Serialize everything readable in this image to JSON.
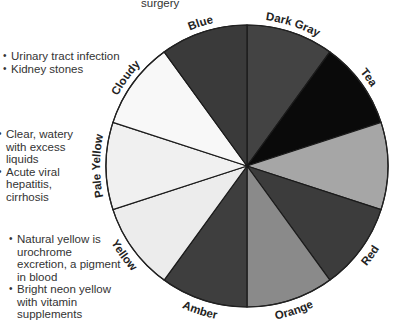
{
  "top_note": "surgery",
  "notes": {
    "cloudy": [
      "Urinary tract infection",
      "Kidney stones"
    ],
    "pale_yellow": [
      "Clear, watery with excess liquids",
      "Acute viral hepatitis, cirrhosis"
    ],
    "yellow": [
      "Natural yellow is urochrome excretion, a pigment in blood",
      "Bright neon yellow with vitamin supplements"
    ]
  },
  "wheel": {
    "center": [
      247,
      166
    ],
    "radius": 141,
    "segments": [
      {
        "label": "Dark Gray",
        "start": 0,
        "end": 36,
        "color": "#434343"
      },
      {
        "label": "Tea",
        "start": 36,
        "end": 72,
        "color": "#0a0a0a"
      },
      {
        "label": "",
        "start": 72,
        "end": 108,
        "color": "#a6a6a6"
      },
      {
        "label": "Red",
        "start": 108,
        "end": 144,
        "color": "#3c3c3c"
      },
      {
        "label": "Orange",
        "start": 144,
        "end": 180,
        "color": "#8a8a8a"
      },
      {
        "label": "Amber",
        "start": 180,
        "end": 216,
        "color": "#3e3e3e"
      },
      {
        "label": "Yellow",
        "start": 216,
        "end": 252,
        "color": "#ececec"
      },
      {
        "label": "Pale Yellow",
        "start": 252,
        "end": 288,
        "color": "#f0f0f0"
      },
      {
        "label": "Cloudy",
        "start": 288,
        "end": 324,
        "color": "#f8f8f8"
      },
      {
        "label": "Blue",
        "start": 324,
        "end": 360,
        "color": "#3a3a3a"
      }
    ]
  }
}
